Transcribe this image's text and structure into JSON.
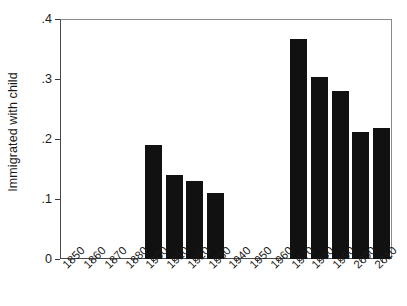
{
  "chart_data": {
    "type": "bar",
    "title": "",
    "subtitle": "",
    "xlabel": "",
    "ylabel": "Immigrated with child",
    "categories": [
      "1850",
      "1860",
      "1870",
      "1880",
      "1900",
      "1910",
      "1920",
      "1930",
      "1940",
      "1950",
      "1960",
      "1970",
      "1980",
      "1990",
      "2000",
      "2010"
    ],
    "values": [
      null,
      null,
      null,
      null,
      0.19,
      0.14,
      0.13,
      0.11,
      null,
      null,
      null,
      0.367,
      0.303,
      0.28,
      0.212,
      0.219
    ],
    "ylim": [
      0,
      0.4
    ],
    "yticks": [
      0,
      0.1,
      0.2,
      0.3,
      0.4
    ],
    "ytick_labels": [
      "0",
      ".1",
      ".2",
      ".3",
      ".4"
    ],
    "grid": false,
    "legend": false,
    "bar_color": "#111111",
    "axis_color": "#4a4a4a",
    "background": "#ffffff",
    "note": "Bars absent for decades 1850-1880 and 1940-1960; tick label for 1890 is not drawn."
  }
}
